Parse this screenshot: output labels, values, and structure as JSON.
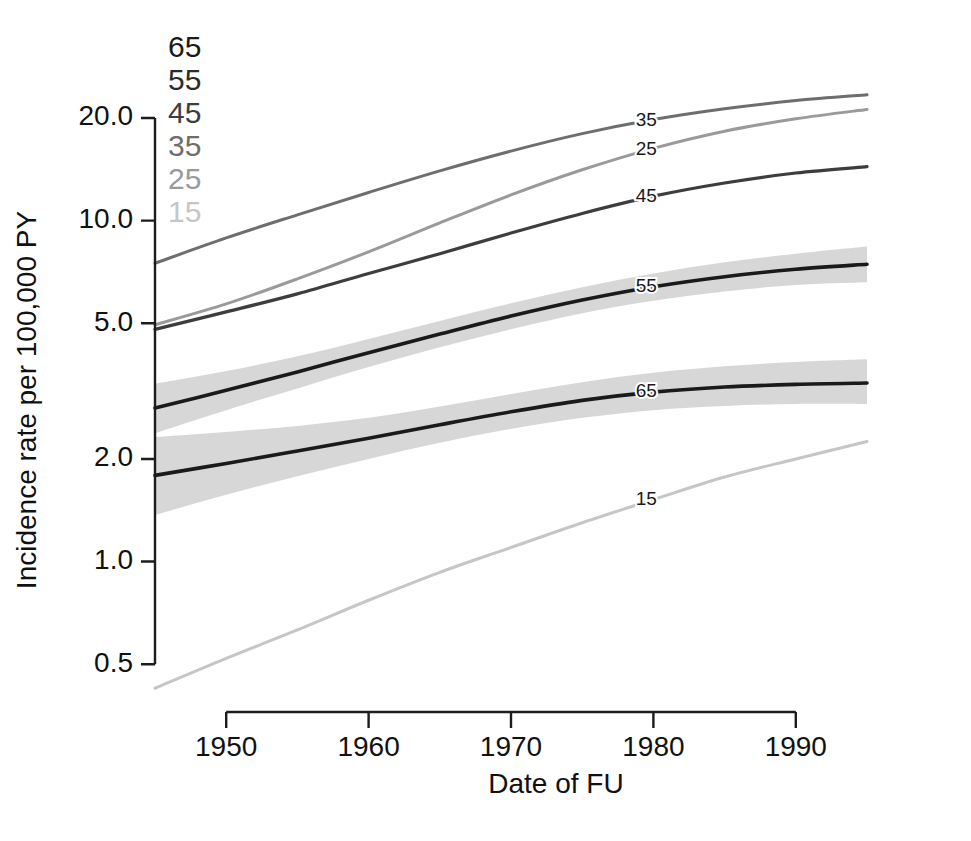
{
  "chart_data": {
    "type": "line",
    "title": "",
    "xlabel": "Date of FU",
    "ylabel": "Incidence rate per 100,000 PY",
    "yscale": "log",
    "xlim": [
      1945,
      1995
    ],
    "ylim": [
      0.42,
      24.5
    ],
    "grid": false,
    "xticks": [
      1950,
      1960,
      1970,
      1980,
      1990
    ],
    "xtick_labels": [
      "1950",
      "1960",
      "1970",
      "1980",
      "1990"
    ],
    "yticks": [
      0.5,
      1.0,
      2.0,
      5.0,
      10.0,
      20.0
    ],
    "ytick_labels": [
      "0.5",
      "1.0",
      "2.0",
      "5.0",
      "10.0",
      "20.0"
    ],
    "legend": {
      "position": "top-left-inside",
      "title": "",
      "entries": [
        {
          "label": "65",
          "color": "#1a1a1a"
        },
        {
          "label": "55",
          "color": "#2b2b2b"
        },
        {
          "label": "45",
          "color": "#3d3d3d"
        },
        {
          "label": "35",
          "color": "#6e6e6e"
        },
        {
          "label": "25",
          "color": "#9a9a9a"
        },
        {
          "label": "15",
          "color": "#c6c6c6"
        }
      ]
    },
    "x": [
      1945,
      1950,
      1955,
      1960,
      1965,
      1970,
      1975,
      1980,
      1985,
      1990,
      1995
    ],
    "series": [
      {
        "name": "35",
        "label": "35",
        "color": "#6e6e6e",
        "linewidth": 3.0,
        "values": [
          7.5,
          8.9,
          10.4,
          12.1,
          14.0,
          16.0,
          18.0,
          19.8,
          21.3,
          22.5,
          23.4
        ],
        "band": null,
        "label_x": 1979.5
      },
      {
        "name": "25",
        "label": "25",
        "color": "#9a9a9a",
        "linewidth": 3.0,
        "values": [
          4.95,
          5.7,
          6.75,
          8.1,
          9.85,
          11.9,
          14.1,
          16.3,
          18.3,
          19.9,
          21.2
        ],
        "band": null,
        "label_x": 1979.5
      },
      {
        "name": "45",
        "label": "45",
        "color": "#3d3d3d",
        "linewidth": 3.2,
        "values": [
          4.8,
          5.4,
          6.1,
          7.0,
          8.0,
          9.2,
          10.5,
          11.8,
          12.9,
          13.8,
          14.4
        ],
        "band": null,
        "label_x": 1979.5
      },
      {
        "name": "55",
        "label": "55",
        "color": "#1a1a1a",
        "linewidth": 3.6,
        "values": [
          2.82,
          3.18,
          3.6,
          4.1,
          4.65,
          5.25,
          5.85,
          6.4,
          6.85,
          7.2,
          7.45
        ],
        "band": {
          "color": "#d7d7d7",
          "lower": [
            2.38,
            2.78,
            3.22,
            3.72,
            4.25,
            4.8,
            5.35,
            5.82,
            6.2,
            6.48,
            6.6
          ],
          "upper": [
            3.32,
            3.62,
            4.0,
            4.5,
            5.08,
            5.72,
            6.38,
            7.0,
            7.55,
            8.0,
            8.4
          ]
        },
        "label_x": 1979.5
      },
      {
        "name": "65",
        "label": "65",
        "color": "#1a1a1a",
        "linewidth": 3.6,
        "values": [
          1.79,
          1.94,
          2.11,
          2.3,
          2.52,
          2.75,
          2.97,
          3.14,
          3.25,
          3.31,
          3.34
        ],
        "band": {
          "color": "#d7d7d7",
          "lower": [
            1.37,
            1.57,
            1.78,
            2.0,
            2.23,
            2.45,
            2.64,
            2.78,
            2.86,
            2.9,
            2.9
          ],
          "upper": [
            2.32,
            2.4,
            2.5,
            2.64,
            2.85,
            3.1,
            3.36,
            3.58,
            3.74,
            3.85,
            3.92
          ]
        },
        "label_x": 1979.5
      },
      {
        "name": "15",
        "label": "15",
        "color": "#c6c6c6",
        "linewidth": 3.0,
        "values": [
          0.425,
          0.52,
          0.63,
          0.77,
          0.93,
          1.1,
          1.3,
          1.52,
          1.77,
          2.0,
          2.25
        ],
        "band": null,
        "label_x": 1979.5
      }
    ],
    "annotations": [
      {
        "text": "35",
        "x": 1979.5,
        "y": 19.6
      },
      {
        "text": "25",
        "x": 1979.5,
        "y": 16.1
      },
      {
        "text": "45",
        "x": 1979.5,
        "y": 11.7
      },
      {
        "text": "55",
        "x": 1979.5,
        "y": 6.4
      },
      {
        "text": "65",
        "x": 1979.5,
        "y": 3.14
      },
      {
        "text": "15",
        "x": 1979.5,
        "y": 1.52
      }
    ]
  },
  "axes": {
    "x_title": "Date of FU",
    "y_title": "Incidence rate per 100,000 PY"
  }
}
